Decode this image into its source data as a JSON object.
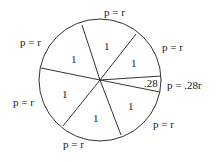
{
  "diagram": {
    "sectors": [
      {
        "value": "1",
        "arc_label": "p = r"
      },
      {
        "value": "1",
        "arc_label": "p = r"
      },
      {
        "value": ".28",
        "arc_label": "p = .28r"
      },
      {
        "value": "1",
        "arc_label": "p = r"
      },
      {
        "value": "1",
        "arc_label": "p = r"
      },
      {
        "value": "1",
        "arc_label": "p = r"
      },
      {
        "value": "1",
        "arc_label": "p = r"
      }
    ]
  }
}
